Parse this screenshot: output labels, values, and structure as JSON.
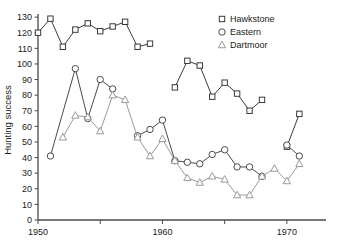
{
  "chart_data": {
    "type": "line",
    "title": "",
    "xlabel": "",
    "ylabel": "Hunting success",
    "xlim": [
      1950,
      1972.5
    ],
    "ylim": [
      0,
      132
    ],
    "grid": false,
    "legend_position": "top-right",
    "x_ticks_major": [
      1950,
      1960,
      1970
    ],
    "x_ticks_minor": [
      1955,
      1965
    ],
    "x_tick_labels": [
      "1950",
      "1960",
      "1970"
    ],
    "y_ticks": [
      0,
      10,
      20,
      30,
      40,
      50,
      60,
      70,
      80,
      90,
      100,
      110,
      120,
      130
    ],
    "y_tick_labels": [
      "0",
      "10",
      "20",
      "30",
      "40",
      "50",
      "60",
      "70",
      "80",
      "90",
      "100",
      "110",
      "120",
      "130"
    ],
    "series": [
      {
        "name": "Hawkstone",
        "marker": "square",
        "color": "#3a3a3a",
        "x": [
          1950,
          1951,
          1952,
          1953,
          1954,
          1955,
          1956,
          1957,
          1958,
          1959,
          1960,
          1961,
          1962,
          1963,
          1964,
          1965,
          1966,
          1967,
          1968,
          1969,
          1970,
          1971
        ],
        "values": [
          120,
          129,
          111,
          122,
          126,
          121,
          124,
          127,
          111,
          113,
          null,
          85,
          102,
          99,
          79,
          88,
          81,
          70,
          77,
          null,
          47,
          68
        ]
      },
      {
        "name": "Eastern",
        "marker": "circle",
        "color": "#4a4a4a",
        "x": [
          1951,
          1953,
          1954,
          1955,
          1956,
          1957,
          1958,
          1959,
          1960,
          1961,
          1962,
          1963,
          1964,
          1965,
          1966,
          1967,
          1968,
          1969,
          1970,
          1971
        ],
        "values": [
          41,
          97,
          65,
          90,
          84,
          null,
          54,
          58,
          64,
          38,
          37,
          36,
          42,
          45,
          34,
          34,
          28,
          null,
          48,
          41
        ]
      },
      {
        "name": "Dartmoor",
        "marker": "triangle",
        "color": "#9a9a9a",
        "x": [
          1952,
          1953,
          1954,
          1955,
          1956,
          1957,
          1958,
          1959,
          1960,
          1961,
          1962,
          1963,
          1964,
          1965,
          1966,
          1967,
          1968,
          1969,
          1970,
          1971
        ],
        "values": [
          53,
          67,
          66,
          57,
          80,
          77,
          53,
          41,
          52,
          38,
          27,
          24,
          28,
          26,
          16,
          16,
          28,
          33,
          25,
          36
        ]
      }
    ]
  },
  "legend": {
    "items": [
      {
        "label": "Hawkstone",
        "marker": "square"
      },
      {
        "label": "Eastern",
        "marker": "circle"
      },
      {
        "label": "Dartmoor",
        "marker": "triangle"
      }
    ]
  },
  "axes": {
    "y_title": "Hunting success"
  }
}
